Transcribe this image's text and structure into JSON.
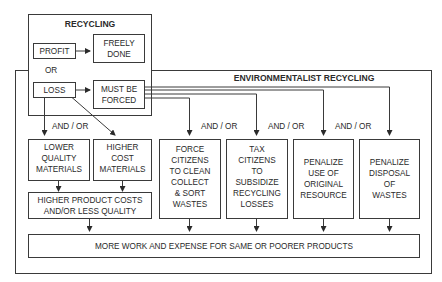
{
  "diagram": {
    "recycling": {
      "title": "RECYCLING",
      "profit": "PROFIT",
      "freely_done": [
        "FREELY",
        "DONE"
      ],
      "or_label": "OR",
      "loss": "LOSS",
      "must_be_forced": [
        "MUST BE",
        "FORCED"
      ]
    },
    "environmentalist": {
      "title": "ENVIRONMENTALIST  RECYCLING",
      "connector_labels": [
        "AND / OR",
        "AND / OR",
        "AND / OR",
        "AND / OR"
      ],
      "boxes": [
        {
          "id": "lower-quality",
          "lines": [
            "LOWER",
            "QUALITY",
            "MATERIALS"
          ]
        },
        {
          "id": "higher-cost",
          "lines": [
            "HIGHER",
            "COST",
            "MATERIALS"
          ]
        },
        {
          "id": "force-citizens",
          "lines": [
            "FORCE",
            "CITIZENS",
            "TO CLEAN",
            "COLLECT",
            "& SORT",
            "WASTES"
          ]
        },
        {
          "id": "tax-citizens",
          "lines": [
            "TAX",
            "CITIZENS",
            "TO",
            "SUBSIDIZE",
            "RECYCLING",
            "LOSSES"
          ]
        },
        {
          "id": "penalize-use",
          "lines": [
            "PENALIZE",
            "USE OF",
            "ORIGINAL",
            "RESOURCE"
          ]
        },
        {
          "id": "penalize-disposal",
          "lines": [
            "PENALIZE",
            "DISPOSAL",
            "OF",
            "WASTES"
          ]
        }
      ],
      "higher_product_costs": [
        "HIGHER PRODUCT COSTS",
        "AND/OR LESS QUALITY"
      ],
      "result": "MORE WORK AND EXPENSE FOR SAME OR POORER PRODUCTS"
    },
    "colors": {
      "stroke": "#3a3a3a",
      "text": "#2a2a2a",
      "background": "#ffffff"
    }
  }
}
